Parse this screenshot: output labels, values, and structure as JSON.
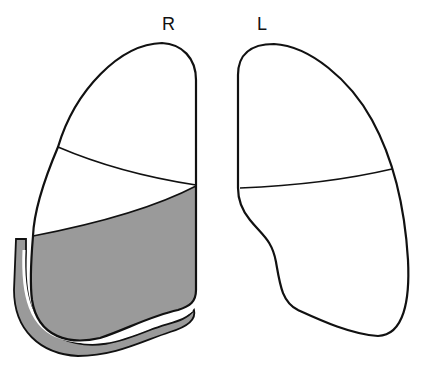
{
  "labels": {
    "right": "R",
    "left": "L"
  },
  "colors": {
    "outline": "#111111",
    "shaded_region": "#9a9a9a",
    "background": "#ffffff"
  },
  "regions": {
    "right_lung": [
      "upper lobe",
      "middle lobe",
      "lower lobe (shaded)"
    ],
    "left_lung": [
      "upper lobe",
      "lower lobe"
    ],
    "pleural_layer": "shaded band along right lung base"
  }
}
